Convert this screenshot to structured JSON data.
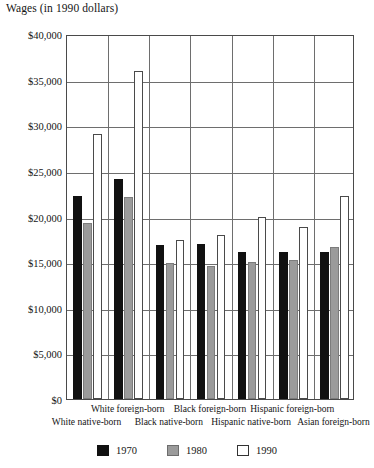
{
  "chart_data": {
    "type": "bar",
    "title": "Wages (in 1990 dollars)",
    "xlabel": "",
    "ylabel": "Wages (in 1990 dollars)",
    "ylim": [
      0,
      40000
    ],
    "ytick_step": 5000,
    "grid": true,
    "legend_position": "bottom",
    "ytick_labels": [
      "$40,000",
      "$35,000",
      "$30,000",
      "$25,000",
      "$20,000",
      "$15,000",
      "$10,000",
      "$5,000",
      "$0"
    ],
    "ytick_values": [
      40000,
      35000,
      30000,
      25000,
      20000,
      15000,
      10000,
      5000,
      0
    ],
    "categories": [
      "White native-born",
      "White foreign-born",
      "Black native-born",
      "Black foreign-born",
      "Hispanic native-born",
      "Hispanic foreign-born",
      "Asian foreign-born"
    ],
    "series": [
      {
        "name": "1970",
        "color": "#111111",
        "values": [
          22200,
          24100,
          16900,
          17000,
          16100,
          16100,
          16100
        ]
      },
      {
        "name": "1980",
        "color": "#9b9b9b",
        "values": [
          19300,
          22100,
          14900,
          14600,
          15000,
          15200,
          16700
        ]
      },
      {
        "name": "1990",
        "color": "#ffffff",
        "values": [
          29000,
          36000,
          17400,
          18000,
          19900,
          18800,
          22200
        ]
      }
    ]
  },
  "legend": {
    "items": [
      {
        "label": "1970",
        "swatch": "black-square"
      },
      {
        "label": "1980",
        "swatch": "gray-square"
      },
      {
        "label": "1990",
        "swatch": "white-square"
      }
    ]
  }
}
